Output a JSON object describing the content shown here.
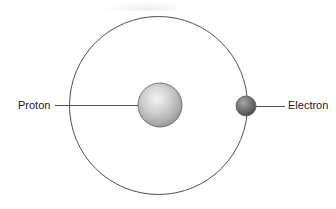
{
  "figure": {
    "name": "hydrogen-atom-diagram",
    "width": 336,
    "height": 209,
    "background_color": "#ffffff"
  },
  "labels": {
    "proton": "Proton",
    "electron": "Electron"
  },
  "colors": {
    "orbit_stroke": "#4f4f4f",
    "leader_line": "#4d4d4d",
    "text": "#1a1a1a",
    "proton_highlight": "#ececec",
    "proton_mid": "#c4c4c4",
    "proton_edge": "#8a8a8a",
    "electron_highlight": "#9c9c9c",
    "electron_mid": "#6e6e6e",
    "electron_edge": "#454545"
  },
  "geometry": {
    "orbit": {
      "cx": 158.5,
      "cy": 105.5,
      "r": 89,
      "stroke_width": 1
    },
    "proton": {
      "cx": 160,
      "cy": 105,
      "r": 22
    },
    "electron": {
      "cx": 246,
      "cy": 106,
      "r": 10
    },
    "proton_leader": {
      "x1": 55,
      "y1": 105,
      "x2": 138,
      "y2": 105
    },
    "electron_leader": {
      "x1": 256,
      "y1": 106,
      "x2": 285,
      "y2": 106
    },
    "proton_label_pos": {
      "x": 18,
      "y": 106
    },
    "electron_label_pos": {
      "x": 288,
      "y": 106
    }
  }
}
